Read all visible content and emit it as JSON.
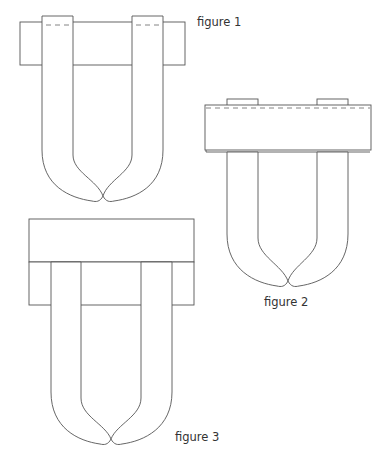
{
  "diagram": {
    "stroke_color": "#555555",
    "background": "#ffffff",
    "figures": [
      {
        "id": "figure-1",
        "label": "figure 1"
      },
      {
        "id": "figure-2",
        "label": "figure 2"
      },
      {
        "id": "figure-3",
        "label": "figure 3"
      }
    ]
  }
}
